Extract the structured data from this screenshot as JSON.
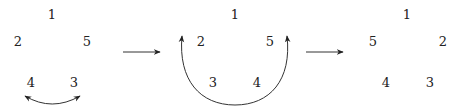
{
  "diagram": {
    "panels": [
      {
        "id": "panel-1",
        "nodes": [
          {
            "label": "1",
            "x": 52,
            "y": 14
          },
          {
            "label": "2",
            "x": 18,
            "y": 41
          },
          {
            "label": "5",
            "x": 87,
            "y": 41
          },
          {
            "label": "4",
            "x": 31,
            "y": 82
          },
          {
            "label": "3",
            "x": 74,
            "y": 82
          }
        ],
        "swap": {
          "between": [
            "4",
            "3"
          ],
          "style": "double-headed arc"
        }
      },
      {
        "id": "panel-2",
        "nodes": [
          {
            "label": "1",
            "x": 235,
            "y": 14
          },
          {
            "label": "2",
            "x": 201,
            "y": 41
          },
          {
            "label": "5",
            "x": 270,
            "y": 41
          },
          {
            "label": "3",
            "x": 213,
            "y": 82
          },
          {
            "label": "4",
            "x": 257,
            "y": 82
          }
        ],
        "swap": {
          "between": [
            "2",
            "5"
          ],
          "style": "double-headed arc"
        }
      },
      {
        "id": "panel-3",
        "nodes": [
          {
            "label": "1",
            "x": 407,
            "y": 14
          },
          {
            "label": "5",
            "x": 373,
            "y": 41
          },
          {
            "label": "2",
            "x": 443,
            "y": 41
          },
          {
            "label": "4",
            "x": 386,
            "y": 82
          },
          {
            "label": "3",
            "x": 430,
            "y": 82
          }
        ]
      }
    ],
    "transitions": [
      {
        "from": "panel-1",
        "to": "panel-2"
      },
      {
        "from": "panel-2",
        "to": "panel-3"
      }
    ],
    "colors": {
      "ink": "#222222",
      "line": "#333333"
    }
  }
}
